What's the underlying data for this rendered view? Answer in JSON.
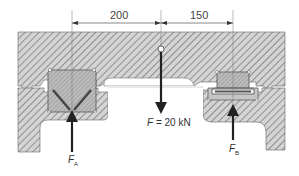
{
  "diagram": {
    "type": "engineering-cross-section",
    "dimensions": {
      "left_span": "200",
      "right_span": "150"
    },
    "load": {
      "symbol": "F",
      "value_text": " = 20 kN"
    },
    "reactions": [
      {
        "symbol": "F",
        "subscript": "A"
      },
      {
        "symbol": "F",
        "subscript": "B"
      }
    ],
    "colors": {
      "hatch_bg": "#d2d2d2",
      "hatch_line": "#7a7a7a",
      "bearing_fill": "#b8b8b8",
      "arrow": "#222222",
      "dim_line": "#555555"
    }
  }
}
